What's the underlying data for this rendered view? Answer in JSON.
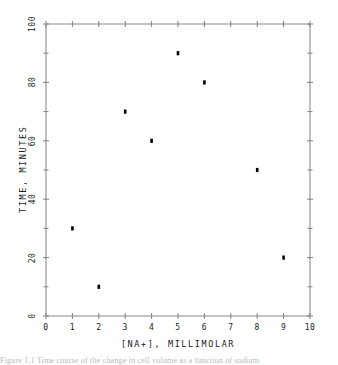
{
  "chart_data": {
    "type": "scatter",
    "title": "",
    "xlabel": "[NA+], MILLIMOLAR",
    "ylabel": "TIME, MINUTES",
    "xlim": [
      0,
      10
    ],
    "ylim": [
      0,
      100
    ],
    "xticks": [
      0,
      1,
      2,
      3,
      4,
      5,
      6,
      7,
      8,
      9,
      10
    ],
    "xtick_labels": [
      "0",
      "1",
      "2",
      "3",
      "4",
      "5",
      "6",
      "7",
      "8",
      "9",
      "10"
    ],
    "yticks": [
      0,
      20,
      40,
      60,
      80,
      100
    ],
    "ytick_labels": [
      "0",
      "20",
      "40",
      "60",
      "80",
      "100"
    ],
    "yminorticks": [
      10,
      30,
      50,
      70,
      90
    ],
    "grid": false,
    "legend": null,
    "marker": "square",
    "marker_color": "#000000",
    "axis_color": "#808080",
    "points": [
      {
        "x": 1,
        "y": 30
      },
      {
        "x": 2,
        "y": 10
      },
      {
        "x": 3,
        "y": 70
      },
      {
        "x": 4,
        "y": 60
      },
      {
        "x": 5,
        "y": 90
      },
      {
        "x": 6,
        "y": 80
      },
      {
        "x": 8,
        "y": 50
      },
      {
        "x": 9,
        "y": 20
      }
    ]
  },
  "caption": {
    "text": "Figure  1.1  Time  course  of  the  change  in  cell  volume  as  a  function  of  sodium"
  }
}
